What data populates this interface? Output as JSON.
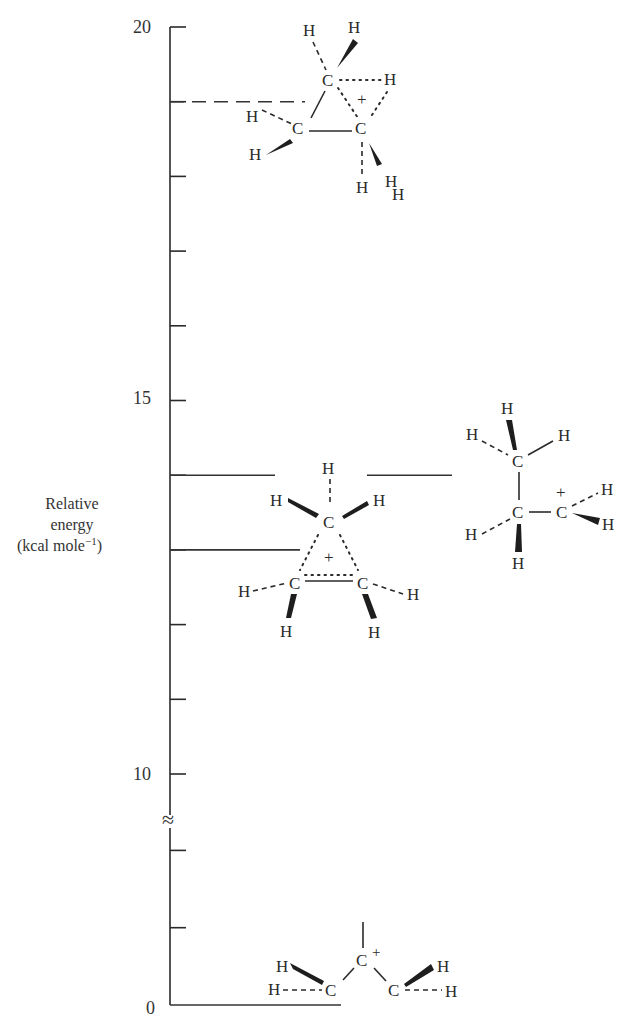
{
  "axis": {
    "title_line1": "Relative",
    "title_line2": "energy",
    "title_line3": "(kcal mole",
    "title_sup": "−1",
    "title_close": ")",
    "tick_labels": [
      "20",
      "15",
      "10",
      "0"
    ],
    "ticks_upper": [
      20,
      19,
      18,
      17,
      16,
      15,
      14,
      13,
      12,
      11,
      10
    ],
    "ticks_lower": [
      0,
      1,
      2
    ],
    "break_marker": "≈"
  },
  "chart_data": {
    "type": "energy-level-diagram",
    "title": "",
    "ylabel": "Relative energy (kcal mole⁻¹)",
    "ylim": [
      0,
      20
    ],
    "axis_break_between": [
      3,
      9.5
    ],
    "levels": [
      {
        "name": "corner-protonated cyclopropane cation",
        "energy": 19,
        "style": "dashed"
      },
      {
        "name": "1-propyl cation",
        "energy": 14,
        "style": "solid"
      },
      {
        "name": "face/edge-protonated cyclopropane",
        "energy": 14,
        "style": "solid"
      },
      {
        "name": "edge-bridged cyclopropyl cation",
        "energy": 13,
        "style": "solid"
      },
      {
        "name": "allyl cation (reference)",
        "energy": 0,
        "style": "solid"
      }
    ]
  },
  "atoms": {
    "H": "H",
    "C": "C",
    "plus": "+"
  }
}
